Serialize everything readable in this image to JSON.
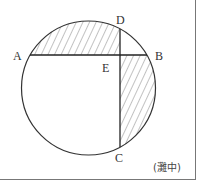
{
  "diagram": {
    "type": "geometry",
    "points": {
      "A": "A",
      "B": "B",
      "C": "C",
      "D": "D",
      "E": "E"
    },
    "source": "(灘中)",
    "colors": {
      "stroke": "#333333",
      "hatch": "#555555",
      "border": "#777777"
    }
  }
}
